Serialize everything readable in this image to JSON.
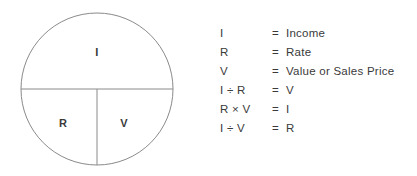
{
  "diagram": {
    "stroke_color": "#8a8a8a",
    "text_color": "#3a3a3a",
    "background_color": "#ffffff",
    "segments": [
      {
        "id": "top",
        "label": "I"
      },
      {
        "id": "bottom-left",
        "label": "R"
      },
      {
        "id": "bottom-right",
        "label": "V"
      }
    ]
  },
  "legend": {
    "rows": [
      {
        "lhs": "I",
        "eq": "=",
        "rhs": "Income"
      },
      {
        "lhs": "R",
        "eq": "=",
        "rhs": "Rate"
      },
      {
        "lhs": "V",
        "eq": "=",
        "rhs": "Value or Sales Price"
      },
      {
        "lhs": "I ÷ R",
        "eq": "=",
        "rhs": "V"
      },
      {
        "lhs": "R × V",
        "eq": "=",
        "rhs": "I"
      },
      {
        "lhs": "I ÷ V",
        "eq": "=",
        "rhs": "R"
      }
    ]
  }
}
